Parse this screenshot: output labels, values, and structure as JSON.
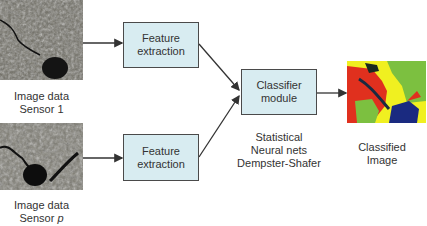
{
  "inputs": [
    {
      "caption_line1": "Image data",
      "caption_line2_prefix": "Sensor ",
      "caption_line2_var": "1"
    },
    {
      "caption_line1": "Image data",
      "caption_line2_prefix": "Sensor ",
      "caption_line2_var": "p"
    }
  ],
  "feature_boxes": [
    {
      "line1": "Feature",
      "line2": "extraction"
    },
    {
      "line1": "Feature",
      "line2": "extraction"
    }
  ],
  "classifier": {
    "line1": "Classifier",
    "line2": "module"
  },
  "methods": [
    "Statistical",
    "Neural nets",
    "Dempster-Shafer"
  ],
  "output": {
    "line1": "Classified",
    "line2": "Image"
  },
  "colors": {
    "box_fill": "#d8ecf1",
    "box_border": "#4a4a4a",
    "arrow": "#333333",
    "class_red": "#e0301e",
    "class_yellow": "#f0f020",
    "class_green": "#7cc040",
    "class_blue": "#1a2a80"
  }
}
